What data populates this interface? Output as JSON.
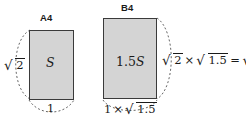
{
  "figure": {
    "kind": "geometry-diagram",
    "background_color": "#ffffff",
    "shape_fill_color": "#d4d4d4",
    "shape_stroke_color": "#3a3a3a",
    "text_color": "#1a1a1a"
  },
  "panels": [
    {
      "tag": "A4",
      "area_label": "S",
      "width_label": "1",
      "height_label": "√2"
    },
    {
      "tag": "B4",
      "area_label": "1.5S",
      "width_label": "1×√1.5",
      "height_label": "√2×√1.5 = √3"
    }
  ],
  "labels": {
    "tag_a4": "A4",
    "tag_b4": "B4",
    "area_a4": "S",
    "area_b4_coefficient": "1.5",
    "area_b4_symbol": "S",
    "radical_sign": "√",
    "a4_height_radicand": "2",
    "a4_width": "1",
    "b4_width_factor": "1",
    "b4_width_times": "×",
    "b4_width_radicand": "1.5",
    "formula_first_radicand": "2",
    "formula_times": "×",
    "formula_second_radicand": "1.5",
    "formula_equals": "=",
    "formula_result_radicand": "3"
  }
}
